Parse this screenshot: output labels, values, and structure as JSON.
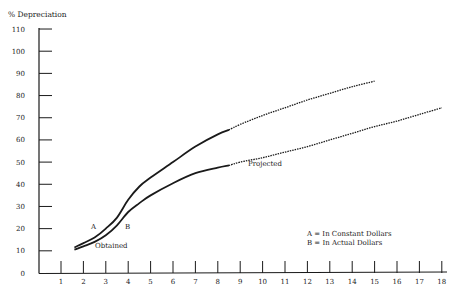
{
  "chart_data": {
    "type": "line",
    "title": "",
    "ylabel": "% Depreciation",
    "xlabel": "",
    "xlim": [
      0,
      18
    ],
    "ylim": [
      0,
      110
    ],
    "x_ticks": [
      1,
      2,
      3,
      4,
      5,
      6,
      7,
      8,
      9,
      10,
      11,
      12,
      13,
      14,
      15,
      16,
      17,
      18
    ],
    "y_ticks": [
      0,
      10,
      20,
      30,
      40,
      50,
      60,
      70,
      80,
      90,
      100,
      110
    ],
    "grid": false,
    "series": [
      {
        "name": "A",
        "label": "A",
        "description": "In Constant Dollars",
        "obtained": {
          "x": [
            1.6,
            2,
            2.5,
            3,
            3.5,
            4,
            4.5,
            5,
            6,
            7,
            8,
            8.5
          ],
          "y": [
            11.5,
            13.5,
            16,
            20,
            25,
            33,
            39,
            43,
            50,
            57,
            62.5,
            64.5
          ]
        },
        "projected": {
          "x": [
            8.5,
            9,
            10,
            11,
            12,
            13,
            14,
            15
          ],
          "y": [
            64.5,
            67,
            71,
            74.5,
            78,
            81,
            84,
            86.5
          ]
        }
      },
      {
        "name": "B",
        "label": "B",
        "description": "In Actual Dollars",
        "obtained": {
          "x": [
            1.6,
            2,
            2.5,
            3,
            3.5,
            4,
            4.5,
            5,
            6,
            7,
            8,
            8.5
          ],
          "y": [
            10.5,
            12,
            14,
            17,
            21.5,
            27.5,
            31.5,
            35,
            40.5,
            45,
            47.5,
            48.5
          ]
        },
        "projected": {
          "x": [
            8.5,
            9,
            10,
            11,
            12,
            13,
            14,
            15,
            16,
            17,
            18
          ],
          "y": [
            48.5,
            50,
            52,
            54.5,
            57,
            60,
            63,
            66,
            68.5,
            71.5,
            74.5
          ]
        }
      }
    ],
    "annotations": [
      {
        "text": "A",
        "x": 2.5,
        "y": 21
      },
      {
        "text": "B",
        "x": 4,
        "y": 21
      },
      {
        "text": "Obtained",
        "x": 2.6,
        "y": 12
      },
      {
        "text": "Projected",
        "x": 9.4,
        "y": 49
      }
    ],
    "legend": {
      "position": "lower-right",
      "entries": [
        "A = In Constant Dollars",
        "B = In Actual Dollars"
      ]
    }
  },
  "labels": {
    "ylabel": "% Depreciation",
    "obtained": "Obtained",
    "projected": "Projected",
    "a": "A",
    "b": "B",
    "legend_a": "A = In Constant Dollars",
    "legend_b": "B = In Actual Dollars"
  },
  "style": {
    "line_color": "#1a1a1a",
    "background": "#ffffff"
  }
}
